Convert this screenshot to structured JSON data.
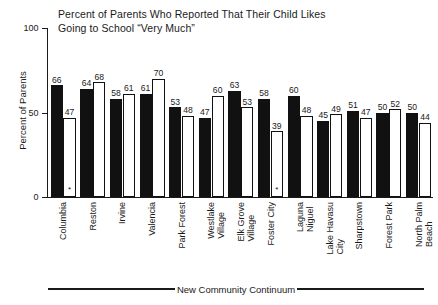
{
  "chart_data": {
    "type": "bar",
    "title": "Percent of Parents Who Reported That Their Child Likes Going to School “Very Much”",
    "title_line1": "Percent of Parents Who Reported That Their Child Likes",
    "title_line2": "Going to School “Very Much”",
    "xlabel": "New Community Continuum",
    "ylabel": "Percent of Parents",
    "ylim": [
      0,
      100
    ],
    "yticks": [
      0,
      50,
      100
    ],
    "ytick_labels": [
      "0",
      "50",
      "100"
    ],
    "grid": false,
    "legend": "none",
    "categories": [
      "Columbia",
      "Reston",
      "Irvine",
      "Valencia",
      "Park Forest",
      "Westlake\nVillage",
      "Elk Grove\nVillage",
      "Foster City",
      "Laguna\nNiguel",
      "Lake Havasu\nCity",
      "Sharpstown",
      "Forest Park",
      "North Palm\nBeach"
    ],
    "series": [
      {
        "name": "dark",
        "color": "#111111",
        "values": [
          66,
          64,
          58,
          61,
          53,
          47,
          63,
          58,
          60,
          45,
          51,
          50,
          50
        ]
      },
      {
        "name": "light",
        "color": "#ffffff",
        "values": [
          47,
          68,
          61,
          70,
          48,
          60,
          53,
          39,
          48,
          49,
          47,
          52,
          44
        ]
      }
    ],
    "annotations": [
      {
        "category": "Columbia",
        "series": "light",
        "marker": "*"
      },
      {
        "category": "Foster City",
        "series": "light",
        "marker": "*"
      }
    ]
  }
}
